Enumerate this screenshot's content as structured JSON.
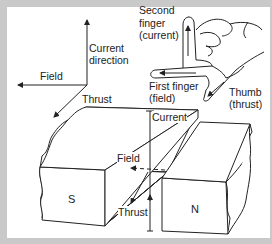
{
  "figure": {
    "axes_diagram": {
      "current_label_line1": "Current",
      "current_label_line2": "direction",
      "field_label": "Field",
      "thrust_label": "Thrust"
    },
    "hand": {
      "second_finger_line1": "Second",
      "second_finger_line2": "finger",
      "second_finger_line3": "(current)",
      "first_finger_line1": "First finger",
      "first_finger_line2": "(field)",
      "thumb_line1": "Thumb",
      "thumb_line2": "(thrust)"
    },
    "magnets": {
      "south_label": "S",
      "north_label": "N",
      "current_label": "Current",
      "field_label": "Field",
      "thrust_label": "Thrust"
    },
    "colors": {
      "frame": "#c9c9c9",
      "panel": "#ffffff",
      "ink": "#222222"
    }
  }
}
